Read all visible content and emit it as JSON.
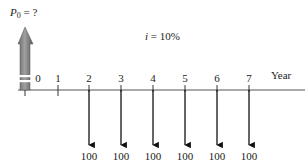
{
  "diagram": {
    "present_value_label": {
      "symbol": "P",
      "subscript": "0",
      "suffix": " = ?"
    },
    "interest_rate": {
      "variable": "i",
      "text": " = 10%"
    },
    "axis_label": "Year",
    "timeline": {
      "periods": [
        "0",
        "1",
        "2",
        "3",
        "4",
        "5",
        "6",
        "7"
      ],
      "tick_x": [
        25,
        58,
        89,
        121,
        153,
        185,
        217,
        249
      ],
      "baseline_y": 90,
      "start_x": 18,
      "end_x": 305
    },
    "cash_flows": [
      {
        "period": "2",
        "amount": "100",
        "direction": "out"
      },
      {
        "period": "3",
        "amount": "100",
        "direction": "out"
      },
      {
        "period": "4",
        "amount": "100",
        "direction": "out"
      },
      {
        "period": "5",
        "amount": "100",
        "direction": "out"
      },
      {
        "period": "6",
        "amount": "100",
        "direction": "out"
      },
      {
        "period": "7",
        "amount": "100",
        "direction": "out"
      }
    ],
    "colors": {
      "line": "#333333",
      "arrow_dark": "#555555",
      "arrow_light": "#9a9a9a",
      "up_arrow_tip": "#6a6a6a"
    }
  }
}
